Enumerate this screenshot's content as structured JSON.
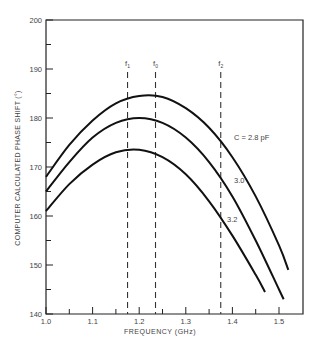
{
  "chart_data": {
    "type": "line",
    "title": "",
    "xlabel": "FREQUENCY (GHz)",
    "ylabel": "COMPUTER CALCULATED PHASE SHIFT (°)",
    "xlim": [
      1.0,
      1.53
    ],
    "ylim": [
      140,
      200
    ],
    "x_ticks": [
      "1.0",
      "1.1",
      "1.2",
      "1.3",
      "1.4",
      "1.5"
    ],
    "y_ticks": [
      "140",
      "150",
      "160",
      "170",
      "180",
      "190",
      "200"
    ],
    "grid": false,
    "series": [
      {
        "name": "C = 2.8 pF",
        "label": "C = 2.8 pF",
        "x": [
          1.0,
          1.05,
          1.1,
          1.15,
          1.2,
          1.25,
          1.3,
          1.35,
          1.4,
          1.45,
          1.5,
          1.52
        ],
        "values": [
          168,
          174.5,
          179.5,
          183,
          184.5,
          184.3,
          182,
          178,
          172,
          164,
          154,
          149
        ]
      },
      {
        "name": "C = 3.0 pF",
        "label": "3.0",
        "x": [
          1.0,
          1.05,
          1.1,
          1.15,
          1.2,
          1.25,
          1.3,
          1.35,
          1.4,
          1.45,
          1.5,
          1.51
        ],
        "values": [
          165,
          171,
          176,
          179,
          180,
          179,
          176,
          171,
          164,
          155,
          145,
          143
        ]
      },
      {
        "name": "C = 3.2 pF",
        "label": "3.2",
        "x": [
          1.0,
          1.05,
          1.1,
          1.15,
          1.2,
          1.25,
          1.3,
          1.35,
          1.4,
          1.45,
          1.47
        ],
        "values": [
          161,
          166.5,
          170.5,
          173,
          173.5,
          172,
          168.5,
          163,
          156,
          148,
          144.5
        ]
      }
    ],
    "annotations": [
      {
        "type": "vline",
        "label": "f1",
        "x": 1.175,
        "style": "dashed"
      },
      {
        "type": "vline",
        "label": "f0",
        "x": 1.235,
        "style": "dashed"
      },
      {
        "type": "vline",
        "label": "f2",
        "x": 1.375,
        "style": "dashed"
      }
    ]
  }
}
